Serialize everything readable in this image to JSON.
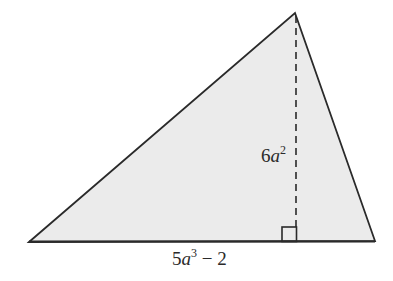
{
  "diagram": {
    "type": "triangle-area",
    "colors": {
      "fill": "#ebebeb",
      "stroke": "#2a2a2a",
      "background": "#ffffff"
    },
    "vertices": {
      "left": [
        29,
        242
      ],
      "apex": [
        295,
        13
      ],
      "right": [
        375,
        241
      ]
    },
    "height_line": {
      "style": "dashed",
      "x": 296,
      "y_top": 15,
      "y_bottom": 241
    },
    "right_angle_marker": {
      "x": 282,
      "y": 227,
      "size": 15
    },
    "labels": {
      "height": {
        "coefficient": "6",
        "variable": "a",
        "exponent": "2",
        "full": "6a²"
      },
      "base": {
        "coefficient": "5",
        "variable": "a",
        "exponent": "3",
        "operator": " − ",
        "constant": "2",
        "full": "5a³ − 2"
      }
    }
  }
}
